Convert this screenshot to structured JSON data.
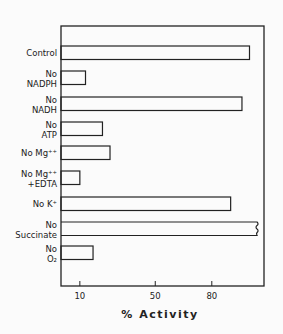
{
  "chart_data": {
    "type": "bar",
    "orientation": "horizontal",
    "title": "",
    "xlabel": "% Activity",
    "ylabel": "",
    "xlim": [
      0,
      108
    ],
    "xticks": [
      10,
      50,
      80
    ],
    "xtick_labels": [
      "10",
      "50",
      "80"
    ],
    "grid": false,
    "legend": null,
    "categories": [
      {
        "line1": "Control",
        "line2": ""
      },
      {
        "line1": "No",
        "line2": "NADPH"
      },
      {
        "line1": "No",
        "line2": "NADH"
      },
      {
        "line1": "No",
        "line2": "ATP"
      },
      {
        "line1": "No Mg⁺⁺",
        "line2": ""
      },
      {
        "line1": "No Mg⁺⁺",
        "line2": "+EDTA"
      },
      {
        "line1": "No K⁺",
        "line2": ""
      },
      {
        "line1": "No",
        "line2": "Succinate"
      },
      {
        "line1": "No",
        "line2": "O₂"
      }
    ],
    "values": [
      100,
      13,
      96,
      22,
      26,
      10,
      90,
      104,
      17
    ],
    "annotations": [
      "No Succinate bar drawn with a break mark at its end (value exceeds drawn range)"
    ]
  },
  "colors": {
    "ink": "#222222",
    "bar_fill": "#fbfbfb",
    "background": "#fbfbfb"
  }
}
